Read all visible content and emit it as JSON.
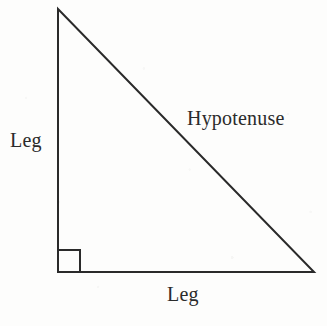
{
  "figure": {
    "name": "right-triangle-parts-diagram",
    "width": 327,
    "height": 326,
    "background_color": "#fdfdfc",
    "stroke_color": "#2a2a2a",
    "text_color": "#2b2b2b",
    "stroke_width": 2
  },
  "labels": {
    "leg_vertical": "Leg",
    "hypotenuse": "Hypotenuse",
    "leg_horizontal": "Leg"
  },
  "geometry": {
    "apex": {
      "x": 58,
      "y": 9
    },
    "right_angle_vertex": {
      "x": 58,
      "y": 272
    },
    "bottom_right_vertex": {
      "x": 314,
      "y": 272
    },
    "right_angle_marker": {
      "name": "right-angle-square",
      "size": 22,
      "x": 58,
      "y": 250
    },
    "path_points": "58,9 58,272 314,272",
    "marker_path": "M 58 250 L 80 250 L 80 272"
  }
}
